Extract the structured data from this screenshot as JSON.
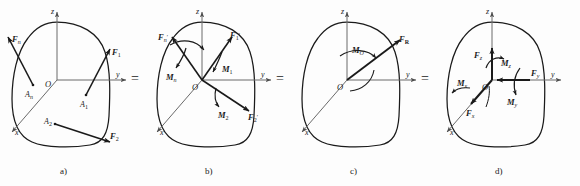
{
  "figure": {
    "title_caption_style": "a) b) c) d)",
    "background_color": "#fdfdfd",
    "ink_color": "#1a1a1a",
    "axis_color": "#5a5a5a",
    "equals_label": "=",
    "panels": [
      {
        "id": "a",
        "caption": "a)",
        "axes": {
          "z": "z",
          "y": "y",
          "x": "x",
          "origin": "O"
        },
        "points": [
          {
            "name": "A_n",
            "base": "A",
            "sub": "n"
          },
          {
            "name": "A_1",
            "base": "A",
            "sub": "1"
          },
          {
            "name": "A_2",
            "base": "A",
            "sub": "2"
          }
        ],
        "forces": [
          {
            "name": "F_n",
            "base": "F",
            "sub": "n",
            "prime": false
          },
          {
            "name": "F_1",
            "base": "F",
            "sub": "1",
            "prime": false
          },
          {
            "name": "F_2",
            "base": "F",
            "sub": "2",
            "prime": false
          }
        ],
        "moments": []
      },
      {
        "id": "b",
        "caption": "b)",
        "axes": {
          "z": "z",
          "y": "y",
          "x": "x",
          "origin": "O"
        },
        "points": [],
        "forces": [
          {
            "name": "F'_n",
            "base": "F",
            "sub": "n",
            "prime": true
          },
          {
            "name": "F'_1",
            "base": "F",
            "sub": "1",
            "prime": true
          },
          {
            "name": "F'_2",
            "base": "F",
            "sub": "2",
            "prime": true
          }
        ],
        "moments": [
          {
            "name": "M_n",
            "base": "M",
            "sub": "n"
          },
          {
            "name": "M_1",
            "base": "M",
            "sub": "1"
          },
          {
            "name": "M_2",
            "base": "M",
            "sub": "2"
          }
        ]
      },
      {
        "id": "c",
        "caption": "c)",
        "axes": {
          "z": "z",
          "y": "y",
          "x": "x",
          "origin": "O"
        },
        "points": [],
        "forces": [
          {
            "name": "F_R",
            "base": "F",
            "sub": "R",
            "prime": false
          }
        ],
        "moments": [
          {
            "name": "M_O",
            "base": "M",
            "sub": "O"
          }
        ]
      },
      {
        "id": "d",
        "caption": "d)",
        "axes": {
          "z": "z",
          "y": "y",
          "x": "x",
          "origin": "O"
        },
        "points": [],
        "forces": [
          {
            "name": "F_z",
            "base": "F",
            "sub": "z",
            "prime": false
          },
          {
            "name": "F_y",
            "base": "F",
            "sub": "y",
            "prime": false
          },
          {
            "name": "F_x",
            "base": "F",
            "sub": "x",
            "prime": false
          }
        ],
        "moments": [
          {
            "name": "M_z",
            "base": "M",
            "sub": "z"
          },
          {
            "name": "M_y",
            "base": "M",
            "sub": "y"
          },
          {
            "name": "M_x",
            "base": "M",
            "sub": "x"
          }
        ]
      }
    ]
  },
  "labels": {
    "F": "F",
    "M": "M",
    "A": "A",
    "O": "O",
    "axis_z": "z",
    "axis_y": "y",
    "axis_x": "x",
    "prime": "′",
    "equals": "=",
    "sub_n": "n",
    "sub_1": "1",
    "sub_2": "2",
    "sub_R": "R",
    "sub_O": "O",
    "sub_x": "x",
    "sub_y": "y",
    "sub_z": "z",
    "cap_a": "a)",
    "cap_b": "b)",
    "cap_c": "c)",
    "cap_d": "d)"
  }
}
